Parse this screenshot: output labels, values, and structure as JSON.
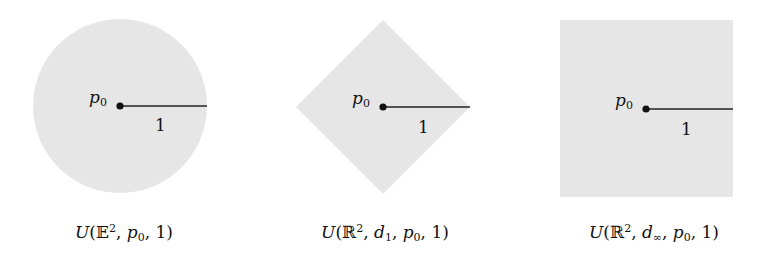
{
  "figure": {
    "fill_color": "#e6e6e6",
    "line_color": "#222222",
    "panels": [
      {
        "id": "euclidean",
        "shape": "circle",
        "center_label": "p₀",
        "center_label_base": "p",
        "center_label_sub": "0",
        "radius_label": "1",
        "caption": "U(𝔼², p₀, 1)",
        "caption_parts": {
          "U": "U",
          "open": "(",
          "space": "𝔼",
          "sup": "2",
          "sep1": ", ",
          "p": "p",
          "p_sub": "0",
          "sep2": ", ",
          "r": "1",
          "close": ")"
        }
      },
      {
        "id": "taxicab",
        "shape": "diamond",
        "center_label": "p₀",
        "center_label_base": "p",
        "center_label_sub": "0",
        "radius_label": "1",
        "caption": "U(ℝ², d₁, p₀, 1)",
        "caption_parts": {
          "U": "U",
          "open": "(",
          "space": "ℝ",
          "sup": "2",
          "sep0": ", ",
          "d": "d",
          "d_sub": "1",
          "sep1": ", ",
          "p": "p",
          "p_sub": "0",
          "sep2": ", ",
          "r": "1",
          "close": ")"
        }
      },
      {
        "id": "chebyshev",
        "shape": "square",
        "center_label": "p₀",
        "center_label_base": "p",
        "center_label_sub": "0",
        "radius_label": "1",
        "caption": "U(ℝ², d∞, p₀, 1)",
        "caption_parts": {
          "U": "U",
          "open": "(",
          "space": "ℝ",
          "sup": "2",
          "sep0": ", ",
          "d": "d",
          "d_sub": "∞",
          "sep1": ", ",
          "p": "p",
          "p_sub": "0",
          "sep2": ", ",
          "r": "1",
          "close": ")"
        }
      }
    ]
  }
}
